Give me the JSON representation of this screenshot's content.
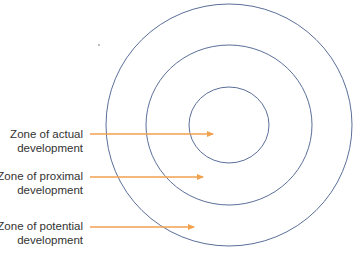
{
  "diagram": {
    "type": "concentric-circles",
    "colors": {
      "circle_stroke": "#5b6f98",
      "arrow": "#f0a24e",
      "text": "#333333"
    },
    "center": {
      "x": 229,
      "y": 125
    },
    "circles": [
      {
        "name": "outer",
        "rx": 123,
        "ry": 121
      },
      {
        "name": "middle",
        "rx": 83,
        "ry": 80
      },
      {
        "name": "inner",
        "rx": 40,
        "ry": 38
      }
    ],
    "zones": [
      {
        "line1": "Zone of actual",
        "line2": "development",
        "label_top": 128,
        "arrow_y": 134,
        "arrow_x1": 90,
        "arrow_x2": 213
      },
      {
        "line1": "Zone of proximal",
        "line2": "development",
        "label_top": 170,
        "arrow_y": 177,
        "arrow_x1": 90,
        "arrow_x2": 203
      },
      {
        "line1": "Zone of potential",
        "line2": "development",
        "label_top": 220,
        "arrow_y": 227,
        "arrow_x1": 90,
        "arrow_x2": 194
      }
    ]
  }
}
